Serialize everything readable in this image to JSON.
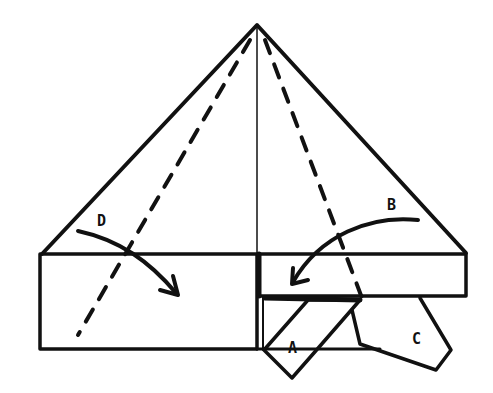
{
  "diagram": {
    "type": "origami-fold-diagram",
    "labels": {
      "A": "A",
      "B": "B",
      "C": "C",
      "D": "D"
    },
    "colors": {
      "stroke": "#111111",
      "background": "#ffffff"
    }
  }
}
